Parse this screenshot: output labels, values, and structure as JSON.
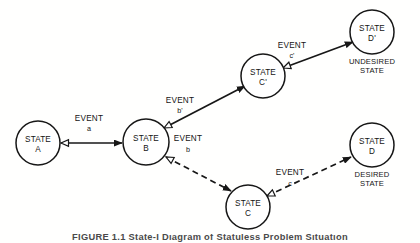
{
  "figure": {
    "caption": "FIGURE 1.1   State-I Diagram of Statuless Problem Situation",
    "background_color": "#ffffff",
    "ink_color": "#171717"
  },
  "diagram": {
    "type": "state-transition-diagram",
    "nodes": [
      {
        "id": "A",
        "line1": "STATE",
        "line2": "A",
        "cx": 38,
        "cy": 143,
        "r": 22,
        "annotation": ""
      },
      {
        "id": "B",
        "line1": "STATE",
        "line2": "B",
        "cx": 146,
        "cy": 142,
        "r": 23,
        "annotation": ""
      },
      {
        "id": "Cprime",
        "line1": "STATE",
        "line2": "C'",
        "cx": 263,
        "cy": 76,
        "r": 22,
        "annotation": ""
      },
      {
        "id": "C",
        "line1": "STATE",
        "line2": "C",
        "cx": 248,
        "cy": 207,
        "r": 22,
        "annotation": ""
      },
      {
        "id": "Dprime",
        "line1": "STATE",
        "line2": "D'",
        "cx": 372,
        "cy": 32,
        "r": 22,
        "annotation_line1": "UNDESIRED",
        "annotation_line2": "STATE"
      },
      {
        "id": "D",
        "line1": "STATE",
        "line2": "D",
        "cx": 372,
        "cy": 145,
        "r": 22,
        "annotation_line1": "DESIRED",
        "annotation_line2": "STATE"
      }
    ],
    "edges": [
      {
        "id": "a",
        "from": "A",
        "to": "B",
        "style": "solid",
        "label_line1": "EVENT",
        "label_line2": "a",
        "label_x": 89,
        "label_y1": 121,
        "label_y2": 131,
        "x1": 61,
        "y1": 143,
        "x2": 122,
        "y2": 143
      },
      {
        "id": "bprime",
        "from": "B",
        "to": "Cprime",
        "style": "solid",
        "label_line1": "EVENT",
        "label_line2": "b'",
        "label_x": 180,
        "label_y1": 103,
        "label_y2": 113,
        "x1": 164,
        "y1": 128,
        "x2": 245,
        "y2": 86
      },
      {
        "id": "cprime",
        "from": "Cprime",
        "to": "Dprime",
        "style": "solid",
        "label_line1": "EVENT",
        "label_line2": "c'",
        "label_x": 292,
        "label_y1": 48,
        "label_y2": 58,
        "x1": 283,
        "y1": 68,
        "x2": 353,
        "y2": 42
      },
      {
        "id": "b",
        "from": "B",
        "to": "C",
        "style": "dashed",
        "label_line1": "EVENT",
        "label_line2": "b",
        "label_x": 188,
        "label_y1": 141,
        "label_y2": 152,
        "x1": 166,
        "y1": 157,
        "x2": 231,
        "y2": 191
      },
      {
        "id": "c",
        "from": "C",
        "to": "D",
        "style": "dashed",
        "label_line1": "EVENT",
        "label_line2": "c",
        "label_x": 290,
        "label_y1": 175,
        "label_y2": 186,
        "x1": 267,
        "y1": 196,
        "x2": 351,
        "y2": 157
      }
    ]
  }
}
